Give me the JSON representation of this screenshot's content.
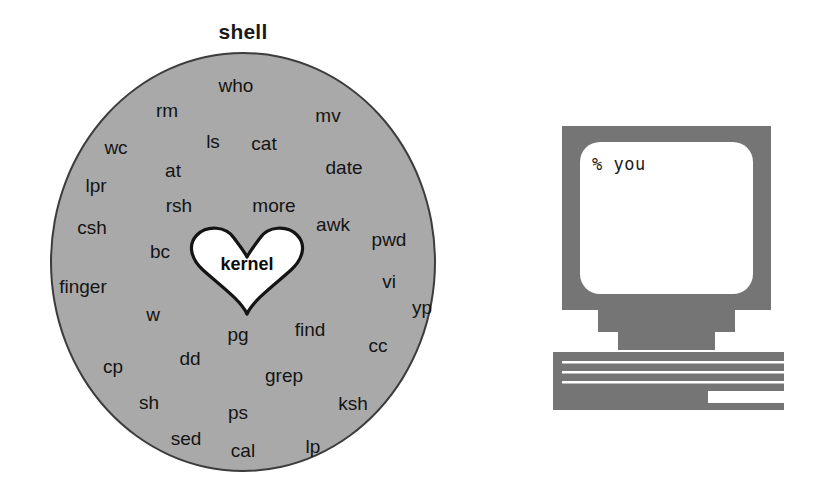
{
  "diagram": {
    "title": "shell",
    "core_label": "kernel",
    "circle_fill": "#a9a9a9",
    "circle_stroke": "#3c3c3c",
    "heart_fill": "#ffffff",
    "heart_stroke": "#141414",
    "text_color": "#141414",
    "commands": [
      {
        "label": "who",
        "x": 236,
        "y": 85
      },
      {
        "label": "rm",
        "x": 167,
        "y": 110
      },
      {
        "label": "mv",
        "x": 328,
        "y": 115
      },
      {
        "label": "wc",
        "x": 116,
        "y": 147
      },
      {
        "label": "ls",
        "x": 213,
        "y": 141
      },
      {
        "label": "cat",
        "x": 264,
        "y": 143
      },
      {
        "label": "at",
        "x": 173,
        "y": 170
      },
      {
        "label": "date",
        "x": 344,
        "y": 167
      },
      {
        "label": "lpr",
        "x": 96,
        "y": 185
      },
      {
        "label": "rsh",
        "x": 179,
        "y": 205
      },
      {
        "label": "more",
        "x": 274,
        "y": 205
      },
      {
        "label": "csh",
        "x": 92,
        "y": 227
      },
      {
        "label": "awk",
        "x": 333,
        "y": 224
      },
      {
        "label": "pwd",
        "x": 389,
        "y": 239
      },
      {
        "label": "bc",
        "x": 160,
        "y": 251
      },
      {
        "label": "finger",
        "x": 83,
        "y": 286
      },
      {
        "label": "vi",
        "x": 389,
        "y": 281
      },
      {
        "label": "yp",
        "x": 422,
        "y": 307
      },
      {
        "label": "w",
        "x": 153,
        "y": 314
      },
      {
        "label": "pg",
        "x": 238,
        "y": 334
      },
      {
        "label": "find",
        "x": 310,
        "y": 329
      },
      {
        "label": "cc",
        "x": 378,
        "y": 345
      },
      {
        "label": "dd",
        "x": 190,
        "y": 358
      },
      {
        "label": "cp",
        "x": 113,
        "y": 366
      },
      {
        "label": "grep",
        "x": 284,
        "y": 375
      },
      {
        "label": "sh",
        "x": 149,
        "y": 402
      },
      {
        "label": "ps",
        "x": 238,
        "y": 412
      },
      {
        "label": "ksh",
        "x": 353,
        "y": 403
      },
      {
        "label": "sed",
        "x": 186,
        "y": 438
      },
      {
        "label": "cal",
        "x": 243,
        "y": 450
      },
      {
        "label": "lp",
        "x": 313,
        "y": 446
      }
    ]
  },
  "computer": {
    "screen_text": "% you",
    "case_color": "#757575",
    "screen_color": "#ffffff",
    "keyboard_color": "#757575",
    "key_line_color": "#ffffff"
  }
}
